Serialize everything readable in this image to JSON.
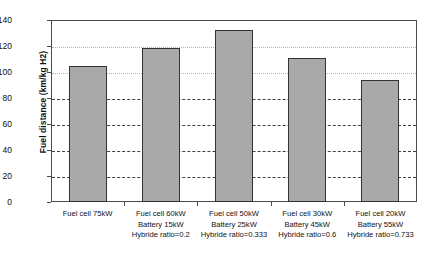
{
  "chart_data": {
    "type": "bar",
    "title": "",
    "xlabel": "",
    "ylabel": "Fuel distance (km/kg H2)",
    "ylim": [
      0,
      140
    ],
    "yticks": [
      0,
      20,
      40,
      60,
      80,
      100,
      120,
      140
    ],
    "ytick_labels": [
      "0",
      "20",
      "40",
      "60",
      "80",
      "100",
      "120",
      "140"
    ],
    "grid": true,
    "legend": "none",
    "bar_color": "#a9a9a9",
    "bar_edge_color": "#333333",
    "categories": [
      "Fuel cell 75kW",
      "Fuel cell 60kW Battery 15kW Hybride ratio=0.2",
      "Fuel cell 50kW Battery 25kW Hybride ratio=0.333",
      "Fuel cell 30kW Battery 45kW Hybride ratio=0.6",
      "Fuel cell 20kW Battery 55kW Hybride ratio=0.733"
    ],
    "category_lines": [
      [
        "Fuel cell 75kW"
      ],
      [
        "Fuel cell 60kW",
        "Battery 15kW",
        "Hybride ratio=0.2"
      ],
      [
        "Fuel cell 50kW",
        "Battery 25kW",
        "Hybride ratio=0.333"
      ],
      [
        "Fuel cell 30kW",
        "Battery 45kW",
        "Hybride ratio=0.6"
      ],
      [
        "Fuel cell 20kW",
        "Battery 55kW",
        "Hybride ratio=0.733"
      ]
    ],
    "values": [
      104.5,
      118.5,
      132,
      111,
      94
    ]
  }
}
